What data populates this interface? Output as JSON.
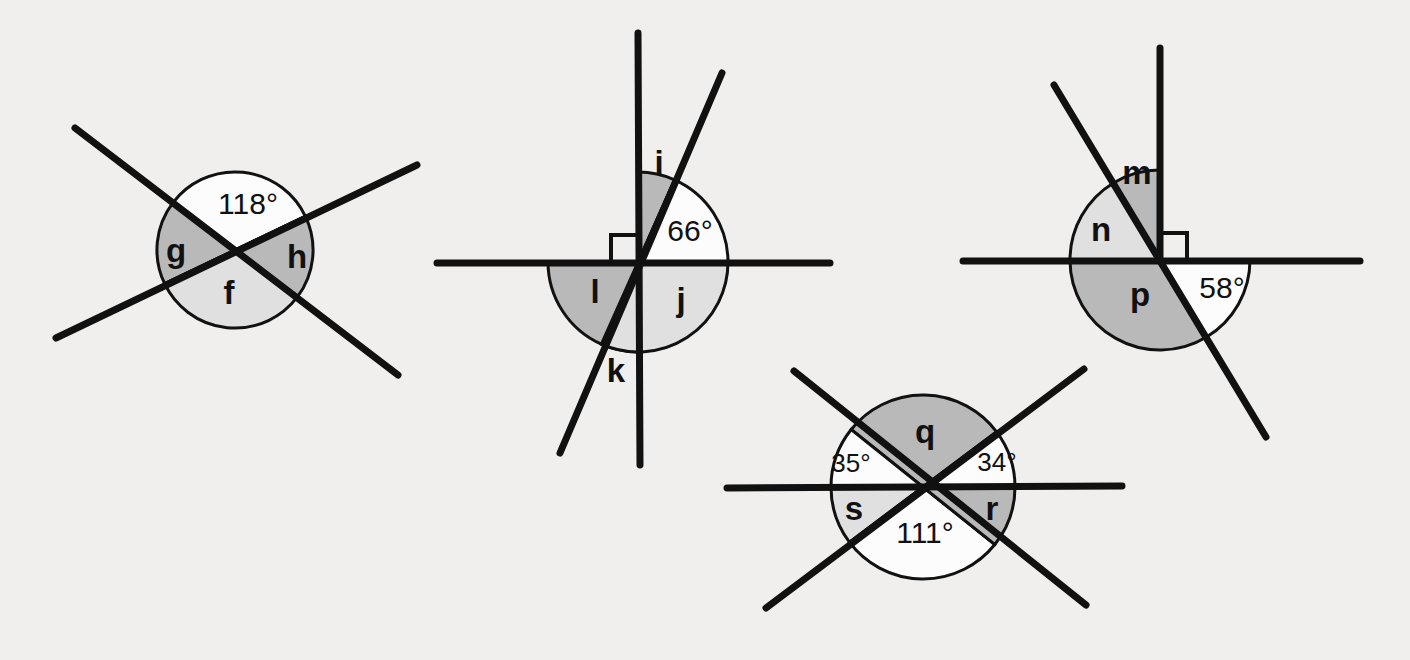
{
  "page": {
    "background_color": "#f0efed",
    "line_color": "#111111",
    "fill_dark": "#b9b9b9",
    "fill_light": "#e0e0e0",
    "fill_white": "#fcfcfc"
  },
  "figures": [
    {
      "id": "figure-1",
      "description": "Two straight lines crossing at a point forming four angles",
      "center": {
        "x": 235,
        "y": 250
      },
      "radius": 78,
      "lines": [
        {
          "name": "line-a",
          "x1": 75,
          "y1": 128,
          "x2": 398,
          "y2": 375
        },
        {
          "name": "line-b",
          "x1": 56,
          "y1": 338,
          "x2": 417,
          "y2": 165
        }
      ],
      "angles": [
        {
          "name": "angle-118",
          "label": "118°",
          "type": "degree",
          "shade": "white",
          "x": 248,
          "y": 206
        },
        {
          "name": "angle-g",
          "label": "g",
          "type": "letter",
          "shade": "dark",
          "x": 176,
          "y": 253
        },
        {
          "name": "angle-h",
          "label": "h",
          "type": "letter",
          "shade": "dark",
          "x": 297,
          "y": 259
        },
        {
          "name": "angle-f",
          "label": "f",
          "type": "letter",
          "shade": "light",
          "x": 229,
          "y": 295
        }
      ]
    },
    {
      "id": "figure-2",
      "description": "A vertical line, a horizontal line and a slanted line meeting at one point; right angle marked",
      "center": {
        "x": 638,
        "y": 262
      },
      "radius": 90,
      "lines": [
        {
          "name": "vertical-line",
          "x1": 638,
          "y1": 33,
          "x2": 640,
          "y2": 465
        },
        {
          "name": "horizontal-line",
          "x1": 437,
          "y1": 263,
          "x2": 830,
          "y2": 263
        },
        {
          "name": "slanted-line",
          "x1": 722,
          "y1": 73,
          "x2": 560,
          "y2": 453
        }
      ],
      "right_angle_marker": {
        "name": "right-angle-mark",
        "quadrant": "upper-left"
      },
      "angles": [
        {
          "name": "angle-i",
          "label": "i",
          "type": "letter",
          "shade": "dark",
          "x": 659,
          "y": 165
        },
        {
          "name": "angle-66",
          "label": "66°",
          "type": "degree",
          "shade": "white",
          "x": 690,
          "y": 233
        },
        {
          "name": "angle-j",
          "label": "j",
          "type": "letter",
          "shade": "light",
          "x": 681,
          "y": 302
        },
        {
          "name": "angle-k",
          "label": "k",
          "type": "letter",
          "shade": "light",
          "x": 616,
          "y": 373
        },
        {
          "name": "angle-l",
          "label": "l",
          "type": "letter",
          "shade": "dark",
          "x": 595,
          "y": 294
        }
      ]
    },
    {
      "id": "figure-3",
      "description": "A horizontal line, an upward vertical ray and a slanted line meeting at one point; right angle marked",
      "center": {
        "x": 1160,
        "y": 260
      },
      "radius": 90,
      "lines": [
        {
          "name": "horizontal-line",
          "x1": 963,
          "y1": 261,
          "x2": 1360,
          "y2": 261
        },
        {
          "name": "vertical-ray",
          "x1": 1160,
          "y1": 48,
          "x2": 1160,
          "y2": 261
        },
        {
          "name": "slanted-line",
          "x1": 1054,
          "y1": 85,
          "x2": 1266,
          "y2": 437
        }
      ],
      "right_angle_marker": {
        "name": "right-angle-mark",
        "quadrant": "upper-right"
      },
      "angles": [
        {
          "name": "angle-m",
          "label": "m",
          "type": "letter",
          "shade": "dark",
          "x": 1137,
          "y": 175
        },
        {
          "name": "angle-n",
          "label": "n",
          "type": "letter",
          "shade": "light",
          "x": 1101,
          "y": 232
        },
        {
          "name": "angle-p",
          "label": "p",
          "type": "letter",
          "shade": "dark",
          "x": 1140,
          "y": 297
        },
        {
          "name": "angle-58",
          "label": "58°",
          "type": "degree",
          "shade": "white",
          "x": 1222,
          "y": 290
        }
      ]
    },
    {
      "id": "figure-4",
      "description": "Three straight lines crossing at one point forming six angles",
      "center": {
        "x": 923,
        "y": 487
      },
      "radius": 92,
      "lines": [
        {
          "name": "horizontal-line",
          "x1": 727,
          "y1": 488,
          "x2": 1122,
          "y2": 486
        },
        {
          "name": "diagonal-down-right",
          "x1": 794,
          "y1": 371,
          "x2": 1086,
          "y2": 605
        },
        {
          "name": "diagonal-up-right",
          "x1": 766,
          "y1": 608,
          "x2": 1084,
          "y2": 369
        }
      ],
      "angles": [
        {
          "name": "angle-q",
          "label": "q",
          "type": "letter",
          "shade": "dark",
          "x": 925,
          "y": 434
        },
        {
          "name": "angle-35",
          "label": "35°",
          "type": "degree-small",
          "shade": "white",
          "x": 851,
          "y": 465
        },
        {
          "name": "angle-34",
          "label": "34°",
          "type": "degree-small",
          "shade": "white",
          "x": 997,
          "y": 464
        },
        {
          "name": "angle-s",
          "label": "s",
          "type": "letter",
          "shade": "light",
          "x": 854,
          "y": 511
        },
        {
          "name": "angle-r",
          "label": "r",
          "type": "letter",
          "shade": "dark",
          "x": 992,
          "y": 511
        },
        {
          "name": "angle-111",
          "label": "111°",
          "type": "degree",
          "shade": "white",
          "x": 925,
          "y": 535
        }
      ]
    }
  ]
}
